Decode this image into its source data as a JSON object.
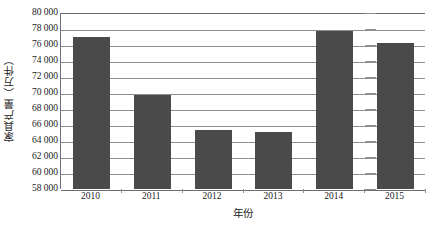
{
  "chart_data": {
    "type": "bar",
    "title": "",
    "xlabel": "年份",
    "ylabel": "家具产量（万件）",
    "categories": [
      "2010",
      "2011",
      "2012",
      "2013",
      "2014",
      "2015"
    ],
    "values": [
      77000,
      69800,
      65400,
      65100,
      77700,
      76200
    ],
    "series": [
      {
        "name": "家具产量",
        "values": [
          77000,
          69800,
          65400,
          65100,
          77700,
          76200
        ]
      }
    ],
    "ylim": [
      58000,
      80000
    ],
    "ytick_step": 2000,
    "ytick_labels": [
      "80 000",
      "78 000",
      "76 000",
      "74 000",
      "72 000",
      "70 000",
      "68 000",
      "66 000",
      "64 000",
      "62 000",
      "60 000",
      "58 000"
    ],
    "ytick_values": [
      80000,
      78000,
      76000,
      74000,
      72000,
      70000,
      68000,
      66000,
      64000,
      62000,
      60000,
      58000
    ],
    "grid": true,
    "legend": false,
    "bar_color": "#4a4a4a",
    "grid_color": "#8e8e8e",
    "axis_color": "#6d6d6d"
  }
}
